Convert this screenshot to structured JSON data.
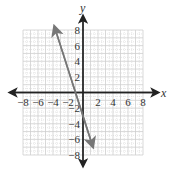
{
  "chart_data": {
    "type": "line",
    "title": "",
    "xlabel": "x",
    "ylabel": "y",
    "xlim": [
      -8,
      8
    ],
    "ylim": [
      -8,
      8
    ],
    "grid": true,
    "minor_grid": true,
    "x_ticks": [
      -8,
      -6,
      -4,
      -2,
      2,
      4,
      6,
      8
    ],
    "y_ticks": [
      8,
      6,
      4,
      2,
      -2,
      -4,
      -6,
      -8
    ],
    "series": [
      {
        "name": "line",
        "equation": "y = -3x - 3",
        "x": [
          -3.8,
          1.3
        ],
        "y": [
          8.4,
          -6.9
        ],
        "color": "#777777",
        "arrows": "both"
      }
    ],
    "legend": null
  },
  "colors": {
    "axis": "#222222",
    "grid": "#cfcfcf",
    "line": "#777777"
  }
}
